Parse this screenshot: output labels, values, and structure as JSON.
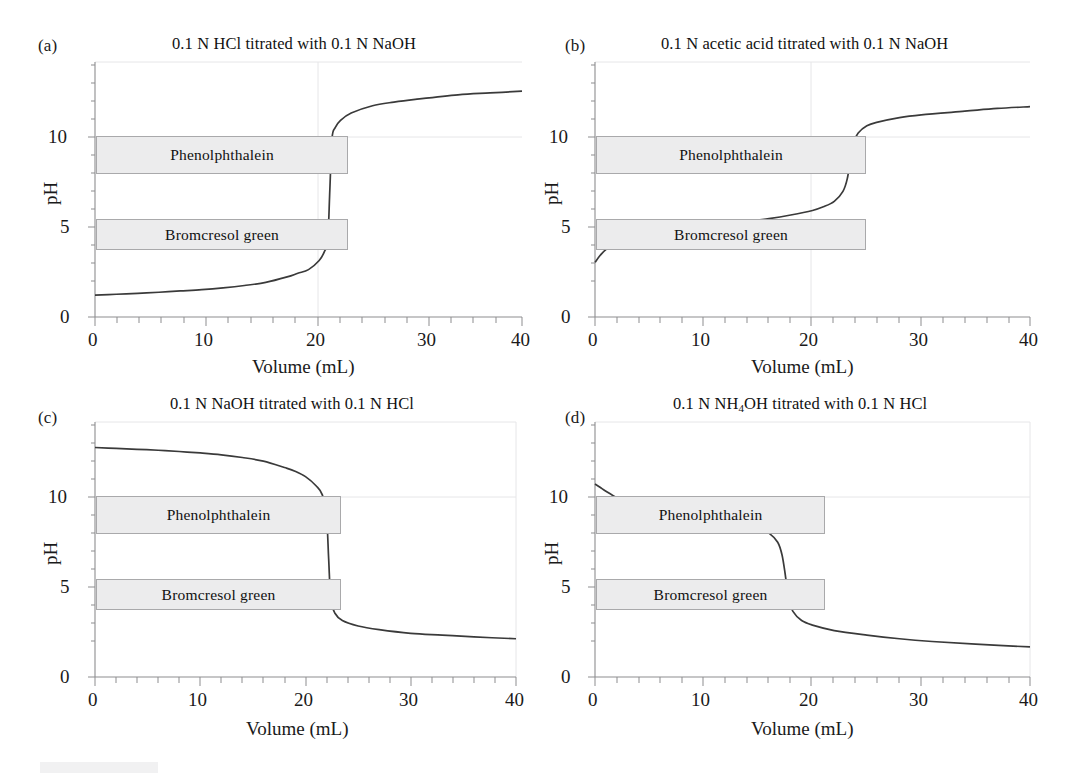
{
  "figure": {
    "axis_x_label": "Volume (mL)",
    "axis_y_label": "pH",
    "x_ticks": [
      "0",
      "10",
      "20",
      "30",
      "40"
    ],
    "y_ticks": [
      "0",
      "5",
      "10"
    ],
    "indicator_phenolphthalein": "Phenolphthalein",
    "indicator_bromcresol": "Bromcresol  green",
    "colors": {
      "curve": "#3a3a3a",
      "box_fill": "#ececed",
      "box_border": "#a9a9ab",
      "axis": "#8d8d8f",
      "text": "#1a1a1a"
    }
  },
  "panels": [
    {
      "tag": "(a)",
      "title_html": "0.1 N HCl titrated with 0.1 N NaOH",
      "title_text": "0.1 N HCl titrated with 0.1 N NaOH"
    },
    {
      "tag": "(b)",
      "title_html": "0.1 N acetic acid titrated with 0.1 N NaOH",
      "title_text": "0.1 N acetic acid titrated with 0.1 N NaOH"
    },
    {
      "tag": "(c)",
      "title_html": "0.1 N NaOH titrated with 0.1 N HCl",
      "title_text": "0.1 N NaOH titrated with 0.1 N HCl"
    },
    {
      "tag": "(d)",
      "title_html": "0.1 N NH<sub>4</sub>OH titrated with 0.1 N HCl",
      "title_text": "0.1 N NH4OH titrated with 0.1 N HCl"
    }
  ],
  "chart_data": [
    {
      "type": "line",
      "panel": "(a)",
      "title": "0.1 N HCl titrated with 0.1 N NaOH",
      "xlabel": "Volume (mL)",
      "ylabel": "pH",
      "xlim": [
        0,
        40
      ],
      "ylim": [
        0,
        14
      ],
      "xticks": [
        0,
        10,
        20,
        30,
        40
      ],
      "yticks": [
        0,
        5,
        10
      ],
      "grid": false,
      "equivalence_volume": 22.0,
      "indicator_ranges": [
        {
          "name": "Phenolphthalein",
          "ph_low": 8.0,
          "ph_high": 10.0,
          "x_start": 0,
          "x_end": 22.8
        },
        {
          "name": "Bromcresol  green",
          "ph_low": 3.8,
          "ph_high": 5.4,
          "x_start": 0,
          "x_end": 22.8
        }
      ],
      "x": [
        0,
        2,
        4,
        6,
        8,
        10,
        12,
        14,
        16,
        18,
        19,
        20,
        21,
        21.5,
        21.8,
        22,
        22.2,
        22.5,
        23,
        24,
        26,
        28,
        30,
        34,
        37,
        40
      ],
      "y": [
        1.2,
        1.25,
        1.3,
        1.36,
        1.43,
        1.5,
        1.6,
        1.73,
        1.9,
        2.2,
        2.4,
        2.6,
        3.1,
        3.6,
        4.2,
        7.0,
        9.8,
        10.4,
        10.8,
        11.2,
        11.6,
        11.8,
        11.95,
        12.2,
        12.3,
        12.4
      ]
    },
    {
      "type": "line",
      "panel": "(b)",
      "title": "0.1 N acetic acid titrated with 0.1 N NaOH",
      "xlabel": "Volume (mL)",
      "ylabel": "pH",
      "xlim": [
        0,
        40
      ],
      "ylim": [
        0,
        14
      ],
      "xticks": [
        0,
        10,
        20,
        30,
        40
      ],
      "yticks": [
        0,
        5,
        10
      ],
      "grid": false,
      "equivalence_volume": 23.5,
      "indicator_ranges": [
        {
          "name": "Phenolphthalein",
          "ph_low": 8.0,
          "ph_high": 10.0,
          "x_start": 0,
          "x_end": 24.6
        },
        {
          "name": "Bromcresol  green",
          "ph_low": 3.8,
          "ph_high": 5.4,
          "x_start": 0,
          "x_end": 24.6
        }
      ],
      "x": [
        0,
        0.5,
        1,
        2,
        3,
        4,
        6,
        8,
        10,
        12,
        14,
        16,
        18,
        20,
        21,
        22,
        22.8,
        23.2,
        23.5,
        23.8,
        24.2,
        25,
        26,
        28,
        30,
        34,
        37,
        40
      ],
      "y": [
        3.0,
        3.4,
        3.7,
        4.1,
        4.3,
        4.45,
        4.65,
        4.8,
        4.95,
        5.1,
        5.25,
        5.4,
        5.6,
        5.85,
        6.05,
        6.35,
        6.9,
        7.6,
        8.7,
        9.6,
        10.1,
        10.5,
        10.7,
        10.95,
        11.1,
        11.3,
        11.45,
        11.55
      ]
    },
    {
      "type": "line",
      "panel": "(c)",
      "title": "0.1 N NaOH titrated with 0.1 N HCl",
      "xlabel": "Volume (mL)",
      "ylabel": "pH",
      "xlim": [
        0,
        40
      ],
      "ylim": [
        0,
        14
      ],
      "xticks": [
        0,
        10,
        20,
        30,
        40
      ],
      "yticks": [
        0,
        5,
        10
      ],
      "grid": false,
      "equivalence_volume": 22.2,
      "indicator_ranges": [
        {
          "name": "Phenolphthalein",
          "ph_low": 8.0,
          "ph_high": 10.0,
          "x_start": 0,
          "x_end": 22.0
        },
        {
          "name": "Bromcresol  green",
          "ph_low": 3.8,
          "ph_high": 5.4,
          "x_start": 0,
          "x_end": 22.0
        }
      ],
      "x": [
        0,
        2,
        4,
        6,
        8,
        10,
        12,
        14,
        16,
        18,
        19,
        20,
        21,
        21.6,
        22,
        22.2,
        22.4,
        22.8,
        23.5,
        25,
        27,
        30,
        33,
        36,
        40
      ],
      "y": [
        12.6,
        12.55,
        12.5,
        12.45,
        12.38,
        12.3,
        12.2,
        12.05,
        11.85,
        11.5,
        11.3,
        11.0,
        10.5,
        10.0,
        8.8,
        6.5,
        4.3,
        3.5,
        3.1,
        2.8,
        2.6,
        2.4,
        2.3,
        2.2,
        2.1
      ]
    },
    {
      "type": "line",
      "panel": "(d)",
      "title": "0.1 N NH4OH titrated with 0.1 N HCl",
      "xlabel": "Volume (mL)",
      "ylabel": "pH",
      "xlim": [
        0,
        40
      ],
      "ylim": [
        0,
        14
      ],
      "xticks": [
        0,
        10,
        20,
        30,
        40
      ],
      "yticks": [
        0,
        5,
        10
      ],
      "grid": false,
      "equivalence_volume": 17.5,
      "indicator_ranges": [
        {
          "name": "Phenolphthalein",
          "ph_low": 8.0,
          "ph_high": 10.0,
          "x_start": 0,
          "x_end": 22.3
        },
        {
          "name": "Bromcresol  green",
          "ph_low": 3.8,
          "ph_high": 5.4,
          "x_start": 0,
          "x_end": 22.3
        }
      ],
      "x": [
        0,
        0.5,
        1,
        2,
        3,
        4,
        6,
        8,
        10,
        12,
        14,
        15,
        16,
        16.8,
        17.2,
        17.5,
        17.8,
        18.2,
        19,
        20,
        22,
        25,
        28,
        31,
        35,
        40
      ],
      "y": [
        10.6,
        10.4,
        10.2,
        9.85,
        9.6,
        9.45,
        9.25,
        9.05,
        8.9,
        8.7,
        8.4,
        8.2,
        7.9,
        7.4,
        6.7,
        5.6,
        4.3,
        3.6,
        3.1,
        2.85,
        2.55,
        2.3,
        2.1,
        1.95,
        1.8,
        1.65
      ]
    }
  ]
}
